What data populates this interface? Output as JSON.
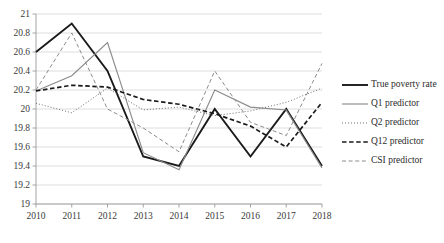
{
  "chart_data": {
    "type": "line",
    "title": "",
    "subtitle": "",
    "xlabel": "",
    "ylabel": "",
    "x": [
      2010,
      2011,
      2012,
      2013,
      2014,
      2015,
      2016,
      2017,
      2018
    ],
    "categories": [
      "2010",
      "2011",
      "2012",
      "2013",
      "2014",
      "2015",
      "2016",
      "2017",
      "2018"
    ],
    "xlim": [
      2010,
      2018
    ],
    "ylim": [
      19,
      21
    ],
    "ytick_labels": [
      "19",
      "19.2",
      "19.4",
      "19.6",
      "19.8",
      "20",
      "20.2",
      "20.4",
      "20.6",
      "20.8",
      "21"
    ],
    "ytick_values": [
      19,
      19.2,
      19.4,
      19.6,
      19.8,
      20,
      20.2,
      20.4,
      20.6,
      20.8,
      21
    ],
    "ytick_step": 0.2,
    "grid": true,
    "grid_axis": "y",
    "legend_position": "right",
    "series": [
      {
        "name": "True poverty rate",
        "key": "true-poverty-rate",
        "style": "solid",
        "color": "#1a1a1a",
        "width": 1.9,
        "values": [
          20.6,
          20.9,
          20.4,
          19.5,
          19.4,
          20.0,
          19.5,
          20.0,
          19.4
        ]
      },
      {
        "name": "Q1 predictor",
        "key": "q1-predictor",
        "style": "solid",
        "color": "#8c8c8c",
        "width": 1.15,
        "values": [
          20.19,
          20.35,
          20.7,
          19.54,
          19.36,
          20.2,
          20.02,
          19.99,
          19.38
        ]
      },
      {
        "name": "Q2 predictor",
        "key": "q2-predictor",
        "style": "dotted",
        "color": "#6e6e6e",
        "width": 1.0,
        "values": [
          20.06,
          19.96,
          20.22,
          19.99,
          20.02,
          19.93,
          19.98,
          20.07,
          20.22
        ]
      },
      {
        "name": "Q12 predictor",
        "key": "q12-predictor",
        "style": "dashed",
        "color": "#1a1a1a",
        "width": 1.7,
        "values": [
          20.19,
          20.25,
          20.23,
          20.1,
          20.05,
          19.95,
          19.82,
          19.6,
          20.07
        ]
      },
      {
        "name": "CSI predictor",
        "key": "csi-predictor",
        "style": "dashed-thin",
        "color": "#8c8c8c",
        "width": 1.0,
        "values": [
          20.2,
          20.8,
          20.0,
          19.8,
          19.55,
          20.4,
          19.86,
          19.72,
          20.48
        ]
      }
    ]
  },
  "legend": {
    "items": [
      {
        "label": "True poverty rate"
      },
      {
        "label": "Q1 predictor"
      },
      {
        "label": "Q2 predictor"
      },
      {
        "label": "Q12 predictor"
      },
      {
        "label": "CSI predictor"
      }
    ]
  }
}
